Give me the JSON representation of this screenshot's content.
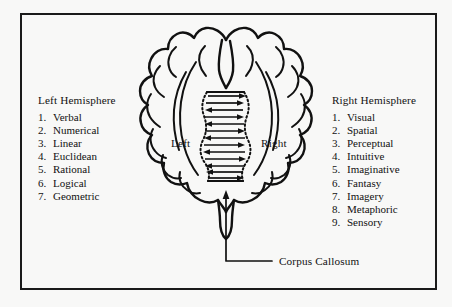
{
  "figure": {
    "type": "diagram",
    "background_color": "#f8f8f7",
    "ink_color": "#111111",
    "frame": "rectangular-border"
  },
  "left_column": {
    "title": "Left Hemisphere",
    "items": [
      {
        "num": "1.",
        "label": "Verbal"
      },
      {
        "num": "2.",
        "label": "Numerical"
      },
      {
        "num": "3.",
        "label": "Linear"
      },
      {
        "num": "4.",
        "label": "Euclidean"
      },
      {
        "num": "5.",
        "label": "Rational"
      },
      {
        "num": "6.",
        "label": "Logical"
      },
      {
        "num": "7.",
        "label": "Geometric"
      }
    ]
  },
  "right_column": {
    "title": "Right Hemisphere",
    "items": [
      {
        "num": "1.",
        "label": "Visual"
      },
      {
        "num": "2.",
        "label": "Spatial"
      },
      {
        "num": "3.",
        "label": "Perceptual"
      },
      {
        "num": "4.",
        "label": "Intuitive"
      },
      {
        "num": "5.",
        "label": "Imaginative"
      },
      {
        "num": "6.",
        "label": "Fantasy"
      },
      {
        "num": "7.",
        "label": "Imagery"
      },
      {
        "num": "8.",
        "label": "Metaphoric"
      },
      {
        "num": "9.",
        "label": "Sensory"
      }
    ]
  },
  "brain": {
    "left_label": "Left",
    "right_label": "Right",
    "corpus_callosum_label": "Corpus Callosum",
    "callosum_arrows": [
      "right",
      "right",
      "left",
      "right",
      "left",
      "right",
      "left",
      "right",
      "left",
      "right",
      "left",
      "right",
      "left",
      "right",
      "left",
      "right"
    ]
  }
}
